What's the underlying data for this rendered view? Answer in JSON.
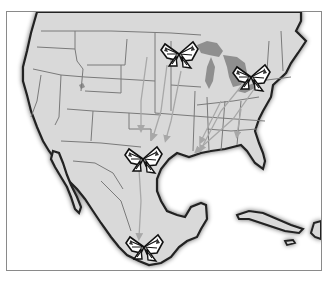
{
  "map": {
    "title": "Monarch butterfly migration routes",
    "region": "North America (United States, Mexico, Caribbean)",
    "colors": {
      "land": "#d9d9d9",
      "water": "#ffffff",
      "lakes": "#8f8f8f",
      "coastline": "#222222",
      "borders": "#7a7a7a",
      "arrows": "#a8a8a8",
      "frame": "#8a8a8a"
    },
    "markers": [
      {
        "name": "butterfly-north-central",
        "location": "Upper Midwest"
      },
      {
        "name": "butterfly-northeast",
        "location": "Great Lakes / Northeast"
      },
      {
        "name": "butterfly-texas",
        "location": "Texas"
      },
      {
        "name": "butterfly-mexico",
        "location": "Central Mexico overwintering site"
      }
    ]
  }
}
